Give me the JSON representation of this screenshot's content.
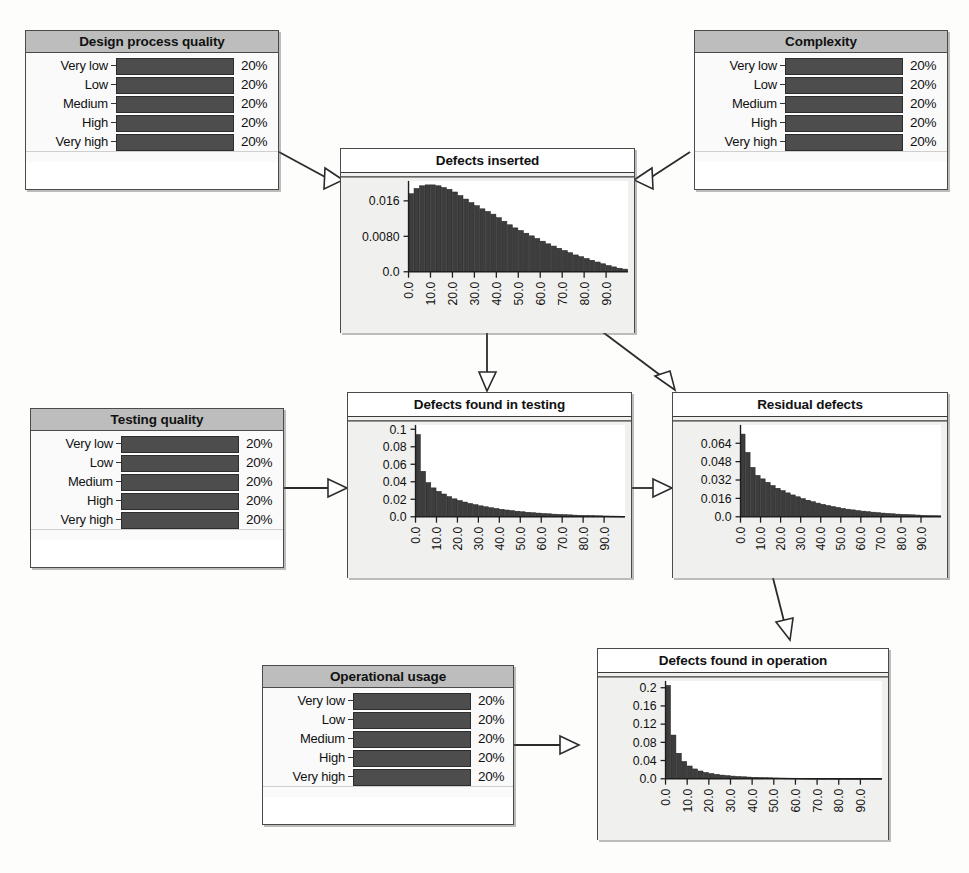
{
  "diagram": {
    "colors": {
      "node_border": "#4a4a4a",
      "discrete_title_bg": "#bdbdbd",
      "bar_fill": "#4d4d4d",
      "plot_bg": "#f0f0ee",
      "plot_area": "#ffffff",
      "edge": "#2b2b2b"
    }
  },
  "discrete_states": [
    "Very low",
    "Low",
    "Medium",
    "High",
    "Very high"
  ],
  "nodes": {
    "design_process_quality": {
      "title": "Design process quality",
      "states": [
        "Very low",
        "Low",
        "Medium",
        "High",
        "Very high"
      ],
      "percents": [
        "20%",
        "20%",
        "20%",
        "20%",
        "20%"
      ],
      "values": [
        20,
        20,
        20,
        20,
        20
      ]
    },
    "complexity": {
      "title": "Complexity",
      "states": [
        "Very low",
        "Low",
        "Medium",
        "High",
        "Very high"
      ],
      "percents": [
        "20%",
        "20%",
        "20%",
        "20%",
        "20%"
      ],
      "values": [
        20,
        20,
        20,
        20,
        20
      ]
    },
    "testing_quality": {
      "title": "Testing quality",
      "states": [
        "Very low",
        "Low",
        "Medium",
        "High",
        "Very high"
      ],
      "percents": [
        "20%",
        "20%",
        "20%",
        "20%",
        "20%"
      ],
      "values": [
        20,
        20,
        20,
        20,
        20
      ]
    },
    "operational_usage": {
      "title": "Operational usage",
      "states": [
        "Very low",
        "Low",
        "Medium",
        "High",
        "Very high"
      ],
      "percents": [
        "20%",
        "20%",
        "20%",
        "20%",
        "20%"
      ],
      "values": [
        20,
        20,
        20,
        20,
        20
      ]
    },
    "defects_inserted": {
      "title": "Defects inserted"
    },
    "defects_found_in_testing": {
      "title": "Defects found in testing"
    },
    "residual_defects": {
      "title": "Residual defects"
    },
    "defects_found_in_operation": {
      "title": "Defects found in operation"
    }
  },
  "edges": [
    {
      "from": "design_process_quality",
      "to": "defects_inserted"
    },
    {
      "from": "complexity",
      "to": "defects_inserted"
    },
    {
      "from": "defects_inserted",
      "to": "defects_found_in_testing"
    },
    {
      "from": "defects_inserted",
      "to": "residual_defects"
    },
    {
      "from": "testing_quality",
      "to": "defects_found_in_testing"
    },
    {
      "from": "defects_found_in_testing",
      "to": "residual_defects"
    },
    {
      "from": "residual_defects",
      "to": "defects_found_in_operation"
    },
    {
      "from": "operational_usage",
      "to": "defects_found_in_operation"
    }
  ],
  "chart_data": [
    {
      "id": "defects_inserted",
      "type": "bar",
      "title": "Defects inserted",
      "xlabel": "",
      "ylabel": "",
      "grid": false,
      "legend": null,
      "xtick_labels": [
        "0.0",
        "10.0",
        "20.0",
        "30.0",
        "40.0",
        "50.0",
        "60.0",
        "70.0",
        "80.0",
        "90.0"
      ],
      "xtick_values": [
        0,
        10,
        20,
        30,
        40,
        50,
        60,
        70,
        80,
        90
      ],
      "ytick_labels": [
        "0.0",
        "0.0080",
        "0.016"
      ],
      "ytick_values": [
        0.0,
        0.008,
        0.016
      ],
      "xlim": [
        0,
        100
      ],
      "ylim": [
        0,
        0.0205
      ],
      "bin_width": 2.5,
      "x": [
        1.25,
        3.75,
        6.25,
        8.75,
        11.25,
        13.75,
        16.25,
        18.75,
        21.25,
        23.75,
        26.25,
        28.75,
        31.25,
        33.75,
        36.25,
        38.75,
        41.25,
        43.75,
        46.25,
        48.75,
        51.25,
        53.75,
        56.25,
        58.75,
        61.25,
        63.75,
        66.25,
        68.75,
        71.25,
        73.75,
        76.25,
        78.75,
        81.25,
        83.75,
        86.25,
        88.75,
        91.25,
        93.75,
        96.25,
        98.75
      ],
      "values": [
        0.0176,
        0.0188,
        0.0194,
        0.0196,
        0.0196,
        0.0194,
        0.019,
        0.0186,
        0.018,
        0.0172,
        0.0164,
        0.0156,
        0.0149,
        0.0142,
        0.0136,
        0.013,
        0.0122,
        0.0114,
        0.0106,
        0.0099,
        0.0093,
        0.0087,
        0.0081,
        0.0075,
        0.0069,
        0.0063,
        0.0058,
        0.0053,
        0.0048,
        0.0043,
        0.0038,
        0.0034,
        0.003,
        0.0026,
        0.0022,
        0.0018,
        0.0014,
        0.0011,
        0.0008,
        0.0006
      ]
    },
    {
      "id": "defects_found_in_testing",
      "type": "bar",
      "title": "Defects found in testing",
      "xlabel": "",
      "ylabel": "",
      "grid": false,
      "legend": null,
      "xtick_labels": [
        "0.0",
        "10.0",
        "20.0",
        "30.0",
        "40.0",
        "50.0",
        "60.0",
        "70.0",
        "80.0",
        "90.0"
      ],
      "xtick_values": [
        0,
        10,
        20,
        30,
        40,
        50,
        60,
        70,
        80,
        90
      ],
      "ytick_labels": [
        "0.0",
        "0.02",
        "0.04",
        "0.06",
        "0.08",
        "0.1"
      ],
      "ytick_values": [
        0.0,
        0.02,
        0.04,
        0.06,
        0.08,
        0.1
      ],
      "xlim": [
        0,
        100
      ],
      "ylim": [
        0,
        0.105
      ],
      "bin_width": 2.5,
      "x": [
        1.25,
        3.75,
        6.25,
        8.75,
        11.25,
        13.75,
        16.25,
        18.75,
        21.25,
        23.75,
        26.25,
        28.75,
        31.25,
        33.75,
        36.25,
        38.75,
        41.25,
        43.75,
        46.25,
        48.75,
        51.25,
        53.75,
        56.25,
        58.75,
        61.25,
        63.75,
        66.25,
        68.75,
        71.25,
        73.75,
        76.25,
        78.75,
        81.25,
        83.75,
        86.25,
        88.75,
        91.25,
        93.75,
        96.25,
        98.75
      ],
      "values": [
        0.094,
        0.052,
        0.039,
        0.033,
        0.029,
        0.026,
        0.023,
        0.0205,
        0.0185,
        0.0168,
        0.0152,
        0.0138,
        0.0125,
        0.0114,
        0.0103,
        0.0094,
        0.0085,
        0.0077,
        0.007,
        0.0063,
        0.0057,
        0.0051,
        0.0046,
        0.0042,
        0.0037,
        0.0034,
        0.003,
        0.0027,
        0.0024,
        0.0022,
        0.0019,
        0.0017,
        0.0015,
        0.0014,
        0.0012,
        0.0011,
        0.0009,
        0.0008,
        0.0007,
        0.0006
      ]
    },
    {
      "id": "residual_defects",
      "type": "bar",
      "title": "Residual defects",
      "xlabel": "",
      "ylabel": "",
      "grid": false,
      "legend": null,
      "xtick_labels": [
        "0.0",
        "10.0",
        "20.0",
        "30.0",
        "40.0",
        "50.0",
        "60.0",
        "70.0",
        "80.0",
        "90.0"
      ],
      "xtick_values": [
        0,
        10,
        20,
        30,
        40,
        50,
        60,
        70,
        80,
        90
      ],
      "ytick_labels": [
        "0.0",
        "0.016",
        "0.032",
        "0.048",
        "0.064"
      ],
      "ytick_values": [
        0.0,
        0.016,
        0.032,
        0.048,
        0.064
      ],
      "xlim": [
        0,
        100
      ],
      "ylim": [
        0,
        0.08
      ],
      "bin_width": 2.5,
      "x": [
        1.25,
        3.75,
        6.25,
        8.75,
        11.25,
        13.75,
        16.25,
        18.75,
        21.25,
        23.75,
        26.25,
        28.75,
        31.25,
        33.75,
        36.25,
        38.75,
        41.25,
        43.75,
        46.25,
        48.75,
        51.25,
        53.75,
        56.25,
        58.75,
        61.25,
        63.75,
        66.25,
        68.75,
        71.25,
        73.75,
        76.25,
        78.75,
        81.25,
        83.75,
        86.25,
        88.75,
        91.25,
        93.75,
        96.25,
        98.75
      ],
      "values": [
        0.072,
        0.056,
        0.043,
        0.036,
        0.033,
        0.03,
        0.0272,
        0.0248,
        0.0228,
        0.0208,
        0.019,
        0.0174,
        0.0158,
        0.0144,
        0.0131,
        0.0119,
        0.0108,
        0.0098,
        0.0089,
        0.0081,
        0.0073,
        0.0066,
        0.006,
        0.0054,
        0.0049,
        0.0044,
        0.004,
        0.0036,
        0.0032,
        0.0029,
        0.0026,
        0.0023,
        0.0021,
        0.0019,
        0.0017,
        0.0015,
        0.0013,
        0.0011,
        0.001,
        0.0009
      ]
    },
    {
      "id": "defects_found_in_operation",
      "type": "bar",
      "title": "Defects found in operation",
      "xlabel": "",
      "ylabel": "",
      "grid": false,
      "legend": null,
      "xtick_labels": [
        "0.0",
        "10.0",
        "20.0",
        "30.0",
        "40.0",
        "50.0",
        "60.0",
        "70.0",
        "80.0",
        "90.0"
      ],
      "xtick_values": [
        0,
        10,
        20,
        30,
        40,
        50,
        60,
        70,
        80,
        90
      ],
      "ytick_labels": [
        "0.0",
        "0.04",
        "0.08",
        "0.12",
        "0.16",
        "0.2"
      ],
      "ytick_values": [
        0.0,
        0.04,
        0.08,
        0.12,
        0.16,
        0.2
      ],
      "xlim": [
        0,
        100
      ],
      "ylim": [
        0,
        0.215
      ],
      "bin_width": 2.5,
      "x": [
        1.25,
        3.75,
        6.25,
        8.75,
        11.25,
        13.75,
        16.25,
        18.75,
        21.25,
        23.75,
        26.25,
        28.75,
        31.25,
        33.75,
        36.25,
        38.75,
        41.25,
        43.75,
        46.25,
        48.75,
        51.25,
        53.75,
        56.25,
        58.75,
        61.25,
        63.75,
        66.25,
        68.75,
        71.25,
        73.75,
        76.25,
        78.75,
        81.25,
        83.75,
        86.25,
        88.75,
        91.25,
        93.75,
        96.25,
        98.75
      ],
      "values": [
        0.205,
        0.096,
        0.056,
        0.038,
        0.028,
        0.0215,
        0.017,
        0.0138,
        0.0114,
        0.0095,
        0.008,
        0.0068,
        0.0058,
        0.005,
        0.0043,
        0.0037,
        0.0032,
        0.0028,
        0.0024,
        0.0021,
        0.0018,
        0.0016,
        0.0014,
        0.0012,
        0.0011,
        0.0009,
        0.0008,
        0.0007,
        0.0006,
        0.0005,
        0.0005,
        0.0004,
        0.0004,
        0.0003,
        0.0003,
        0.0002,
        0.0002,
        0.0002,
        0.0001,
        0.0001
      ]
    }
  ]
}
